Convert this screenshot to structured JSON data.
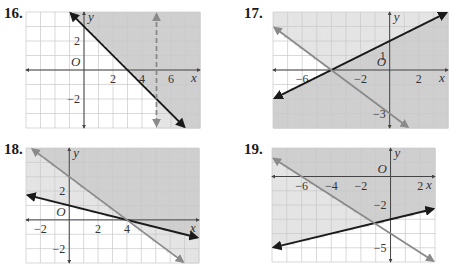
{
  "problems": [
    {
      "number": "16.",
      "origin_label": "O",
      "x_label": "x",
      "y_label": "y",
      "x_range": [
        -4,
        8
      ],
      "y_range": [
        -4,
        4
      ],
      "x_ticks": [
        {
          "value": 2,
          "label": "2"
        },
        {
          "value": 4,
          "label": "4"
        },
        {
          "value": 6,
          "label": "6"
        }
      ],
      "y_ticks": [
        {
          "value": 2,
          "label": "2"
        },
        {
          "value": -2,
          "label": "−2"
        }
      ],
      "lines": [
        {
          "name": "solid-line",
          "type": "slope",
          "slope": -1,
          "intercept": 3,
          "style": "solid",
          "color": "#1a1a1a"
        },
        {
          "name": "dashed-vertical-line",
          "type": "vertical",
          "x": 5,
          "style": "dashed",
          "color": "#8a8a8a"
        }
      ],
      "shading": "above solid line y = -x + 3, and right of x = 5"
    },
    {
      "number": "17.",
      "origin_label": "O",
      "x_label": "x",
      "y_label": "y",
      "x_range": [
        -8,
        4
      ],
      "y_range": [
        -4,
        4
      ],
      "x_ticks": [
        {
          "value": -6,
          "label": "−6"
        },
        {
          "value": -2,
          "label": "−2"
        },
        {
          "value": 2,
          "label": "2"
        }
      ],
      "y_ticks": [
        {
          "value": 1,
          "label": "1"
        },
        {
          "value": -3,
          "label": "−3"
        }
      ],
      "lines": [
        {
          "name": "dark-line",
          "type": "slope",
          "slope": 0.5,
          "intercept": 2,
          "style": "solid",
          "color": "#1a1a1a"
        },
        {
          "name": "gray-line",
          "type": "slope",
          "slope": -0.75,
          "intercept": -3,
          "style": "solid",
          "color": "#8a8a8a"
        }
      ],
      "shading": "below dark line y = x/2 + 2 (darker), and above gray line y = -3x/4 - 3"
    },
    {
      "number": "18.",
      "origin_label": "O",
      "x_label": "x",
      "y_label": "y",
      "x_range": [
        -3,
        9
      ],
      "y_range": [
        -3,
        5
      ],
      "x_ticks": [
        {
          "value": -2,
          "label": "−2"
        },
        {
          "value": 2,
          "label": "2"
        },
        {
          "value": 4,
          "label": "4"
        }
      ],
      "y_ticks": [
        {
          "value": 2,
          "label": "2"
        },
        {
          "value": -2,
          "label": "−2"
        }
      ],
      "lines": [
        {
          "name": "dark-line",
          "type": "slope",
          "slope": -0.25,
          "intercept": 1,
          "style": "solid",
          "color": "#1a1a1a"
        },
        {
          "name": "gray-line",
          "type": "slope",
          "slope": -0.75,
          "intercept": 3,
          "style": "solid",
          "color": "#8a8a8a"
        }
      ],
      "shading": "above dark line y = -x/4 + 1, and above gray line y = -3x/4 + 3"
    },
    {
      "number": "19.",
      "origin_label": "O",
      "x_label": "x",
      "y_label": "y",
      "x_range": [
        -8,
        3
      ],
      "y_range": [
        -6,
        2
      ],
      "x_ticks": [
        {
          "value": -6,
          "label": "−6"
        },
        {
          "value": -4,
          "label": "−4"
        },
        {
          "value": -2,
          "label": "−2"
        },
        {
          "value": 2,
          "label": "2"
        }
      ],
      "y_ticks": [
        {
          "value": -2,
          "label": "−2"
        },
        {
          "value": -5,
          "label": "−5"
        }
      ],
      "lines": [
        {
          "name": "dark-line",
          "type": "slope",
          "slope": 0.25,
          "intercept": -3,
          "style": "solid",
          "color": "#1a1a1a"
        },
        {
          "name": "gray-line",
          "type": "slope",
          "slope": -0.6667,
          "intercept": -4,
          "style": "solid",
          "color": "#8a8a8a"
        }
      ],
      "shading": "above dark line y = x/4 - 3, and above gray line y = -2x/3 - 4"
    }
  ],
  "colors": {
    "shade": "#cfcfcf",
    "shade_light": "#e4e4e4",
    "grid": "#c8c8c8",
    "axis": "#444444"
  }
}
